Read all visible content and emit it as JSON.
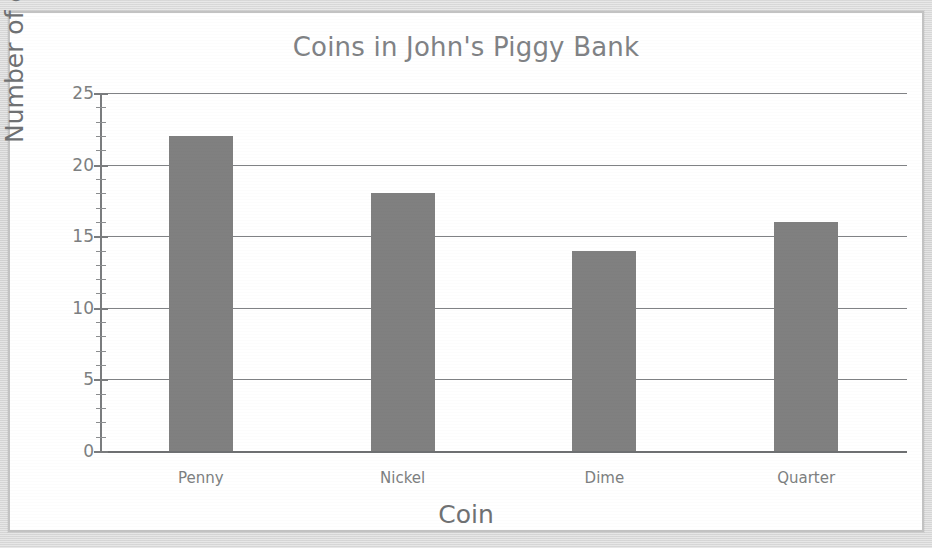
{
  "chart_data": {
    "type": "bar",
    "title": "Coins in John's Piggy Bank",
    "xlabel": "Coin",
    "ylabel": "Number of coins",
    "categories": [
      "Penny",
      "Nickel",
      "Dime",
      "Quarter"
    ],
    "values": [
      22,
      18,
      14,
      16
    ],
    "ylim": [
      0,
      25
    ],
    "ytick_labels": [
      "0",
      "5",
      "10",
      "15",
      "20",
      "25"
    ],
    "ytick_values": [
      0,
      5,
      10,
      15,
      20,
      25
    ],
    "y_minor_tick_step": 1,
    "grid": "horizontal",
    "legend": "none",
    "bar_color": "#808080",
    "axis_color": "#7d7f81",
    "title_color": "#808285",
    "plot_background": "#ffffff",
    "page_background": "#d8d8d8"
  }
}
